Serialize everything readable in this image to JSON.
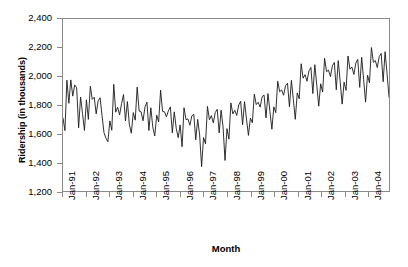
{
  "chart_data": {
    "type": "line",
    "title": "",
    "xlabel": "Month",
    "ylabel": "Ridership (in thousands)",
    "ylim": [
      1200,
      2400
    ],
    "ytick_labels": [
      "2,400",
      "2,200",
      "2,000",
      "1,800",
      "1,600",
      "1,400",
      "1,200"
    ],
    "ytick_values": [
      2400,
      2200,
      2000,
      1800,
      1600,
      1400,
      1200
    ],
    "xtick_labels": [
      "Jan-91",
      "Jan-92",
      "Jan-93",
      "Jan-94",
      "Jan-95",
      "Jan-96",
      "Jan-97",
      "Jan-98",
      "Jan-99",
      "Jan-00",
      "Jan-01",
      "Jan-02",
      "Jan-03",
      "Jan-04"
    ],
    "grid": false,
    "legend": "none",
    "line_color": "#1a1a1a",
    "frame_color": "#8a8a8a",
    "x_start_label": "Jan-91",
    "x_end_label": "Dec-04",
    "series": [
      {
        "name": "Ridership",
        "values": [
          1709,
          1621,
          1973,
          1812,
          1975,
          1862,
          1940,
          1920,
          1641,
          1856,
          1740,
          1622,
          1836,
          1700,
          1931,
          1839,
          1854,
          1738,
          1829,
          1851,
          1726,
          1607,
          1568,
          1544,
          1689,
          1624,
          1944,
          1750,
          1784,
          1731,
          1810,
          1873,
          1689,
          1824,
          1663,
          1603,
          1747,
          1694,
          1925,
          1758,
          1752,
          1690,
          1787,
          1820,
          1622,
          1781,
          1645,
          1584,
          1729,
          1682,
          1903,
          1756,
          1752,
          1718,
          1760,
          1787,
          1606,
          1752,
          1638,
          1572,
          1661,
          1509,
          1781,
          1698,
          1703,
          1659,
          1724,
          1736,
          1557,
          1700,
          1590,
          1370,
          1573,
          1529,
          1790,
          1697,
          1726,
          1675,
          1748,
          1770,
          1605,
          1764,
          1646,
          1413,
          1635,
          1562,
          1815,
          1738,
          1763,
          1727,
          1800,
          1826,
          1662,
          1823,
          1702,
          1588,
          1709,
          1676,
          1876,
          1803,
          1819,
          1785,
          1858,
          1869,
          1710,
          1880,
          1756,
          1631,
          1787,
          1747,
          1966,
          1893,
          1905,
          1868,
          1935,
          1952,
          1788,
          1972,
          1838,
          1700,
          1884,
          1843,
          2088,
          1987,
          2012,
          1966,
          2038,
          2062,
          1880,
          2081,
          1938,
          1792,
          1948,
          1890,
          2126,
          2032,
          2044,
          1998,
          2074,
          2097,
          1906,
          2110,
          1962,
          1806,
          1960,
          1902,
          2142,
          2050,
          2065,
          2013,
          2092,
          2118,
          1923,
          2133,
          1978,
          1820,
          2008,
          1955,
          2201,
          2098,
          2110,
          2061,
          2138,
          2160,
          1962,
          2172,
          2018,
          1855
        ]
      }
    ]
  }
}
